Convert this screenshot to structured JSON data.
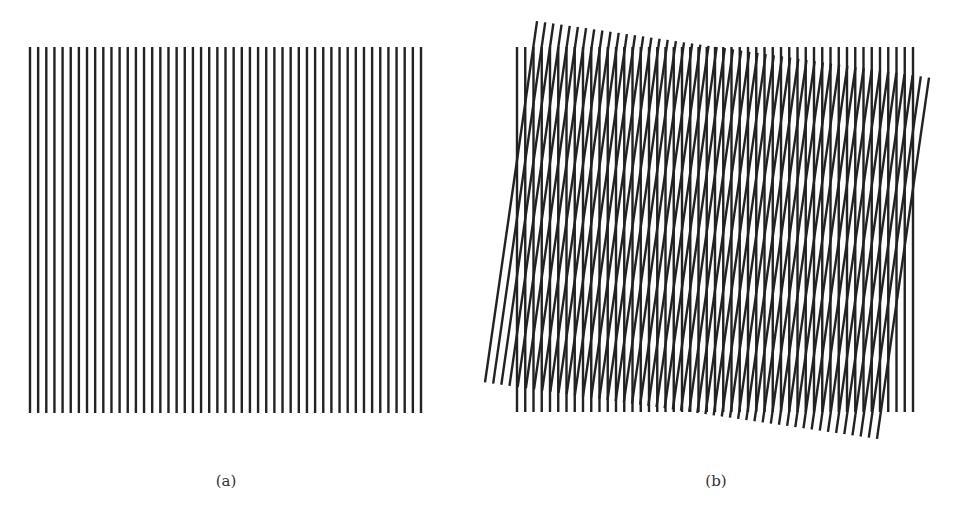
{
  "figure": {
    "panels": [
      {
        "id": "a",
        "caption": "(a)",
        "description": "Single grating of vertical parallel lines",
        "grating": {
          "x0": 30,
          "y0": 47,
          "x1": 421,
          "y1": 413,
          "line_count": 49,
          "rotation_deg": 0
        }
      },
      {
        "id": "b",
        "caption": "(b)",
        "description": "Two superimposed gratings, one rotated, producing moiré pattern",
        "gratings": [
          {
            "x0": 517,
            "y0": 47,
            "x1": 913,
            "y1": 412,
            "line_count": 49,
            "rotation_deg": 0
          },
          {
            "cx": 707,
            "cy": 230,
            "width": 396,
            "height": 365,
            "line_count": 49,
            "rotation_deg": 8.2
          }
        ]
      }
    ],
    "line_color": "#222222",
    "line_width": 2.4
  }
}
